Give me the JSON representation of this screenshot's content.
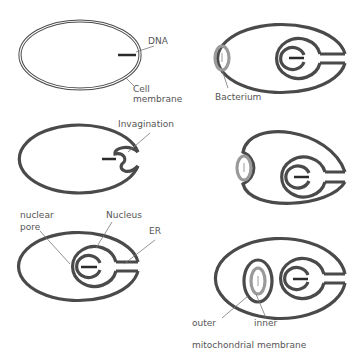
{
  "diagram": {
    "panels": [
      {
        "id": "p1",
        "labels": {
          "dna": "DNA",
          "cell_membrane_1": "Cell",
          "cell_membrane_2": "membrane"
        }
      },
      {
        "id": "p2",
        "labels": {
          "invagination": "Invagination"
        }
      },
      {
        "id": "p3",
        "labels": {
          "nuclear_pore_1": "nuclear",
          "nuclear_pore_2": "pore",
          "nucleus": "Nucleus",
          "er": "ER"
        }
      },
      {
        "id": "p4",
        "labels": {
          "bacterium": "Bacterium"
        }
      },
      {
        "id": "p5",
        "labels": {}
      },
      {
        "id": "p6",
        "labels": {
          "outer": "outer",
          "inner": "inner",
          "mito_membrane": "mitochondrial membrane"
        }
      }
    ],
    "colors": {
      "membrane": "#4a4a4a",
      "bacterium": "#9a9a9a",
      "label": "#555555",
      "background": "#ffffff"
    }
  }
}
